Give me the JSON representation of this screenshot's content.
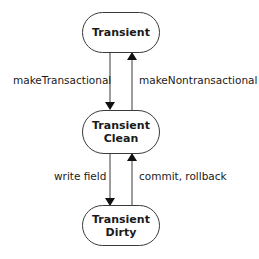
{
  "diagram": {
    "type": "state-transition",
    "states": [
      {
        "id": "transient",
        "line1": "Transient",
        "line2": ""
      },
      {
        "id": "transient-clean",
        "line1": "Transient",
        "line2": "Clean"
      },
      {
        "id": "transient-dirty",
        "line1": "Transient",
        "line2": "Dirty"
      }
    ],
    "transitions": [
      {
        "from": "transient",
        "to": "transient-clean",
        "label": "makeTransactional"
      },
      {
        "from": "transient-clean",
        "to": "transient",
        "label": "makeNontransactional"
      },
      {
        "from": "transient-clean",
        "to": "transient-dirty",
        "label": "write field"
      },
      {
        "from": "transient-dirty",
        "to": "transient-clean",
        "label": "commit, rollback"
      }
    ],
    "colors": {
      "stroke": "#3a3a3a",
      "text": "#1a1a1a",
      "background": "#ffffff"
    }
  }
}
